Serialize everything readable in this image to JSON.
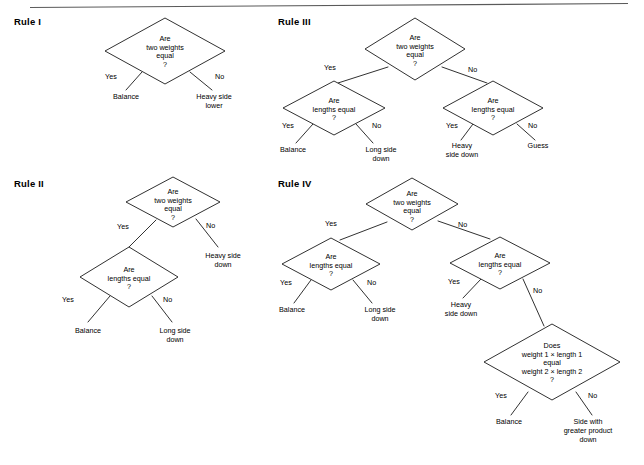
{
  "page": {
    "header_rule_visible": true,
    "header_ghost_text": "",
    "background_color": "#ffffff",
    "ink_color": "#1a1a1a",
    "width": 644,
    "height": 465
  },
  "common_text": {
    "q_two_weights": [
      "Are",
      "two weights",
      "equal",
      "?"
    ],
    "q_lengths": [
      "Are",
      "lengths equal",
      "?"
    ],
    "q_product": [
      "Does",
      "weight 1  ×  length 1",
      "equal",
      "weight 2  ×  length 2",
      "?"
    ],
    "yes": "Yes",
    "no": "No",
    "balance": "Balance",
    "heavy_side_lower": [
      "Heavy side",
      "lower"
    ],
    "heavy_side_down": [
      "Heavy side",
      "down"
    ],
    "heavy_side_down_alt": [
      "Heavy",
      "side down"
    ],
    "long_side_down": [
      "Long side",
      "down"
    ],
    "guess": "Guess",
    "side_with_greater_product_down": [
      "Side with",
      "greater product",
      "down"
    ]
  },
  "rules": [
    {
      "id": "rule-1",
      "title": "Rule I",
      "title_pos": {
        "x": 14,
        "y": 25
      },
      "nodes": [
        {
          "id": "r1-q1",
          "kind": "diamond",
          "cx": 165,
          "cy": 51,
          "rx": 60,
          "ry": 33,
          "lines": [
            "Are",
            "two weights",
            "equal",
            "?"
          ],
          "text_dy": -10
        }
      ],
      "leaves": [
        {
          "id": "r1-leaf-yes",
          "x": 126,
          "y": 99,
          "lines": [
            "Balance"
          ]
        },
        {
          "id": "r1-leaf-no",
          "x": 214,
          "y": 99,
          "lines": [
            "Heavy side",
            "lower"
          ]
        }
      ],
      "edges": [
        {
          "id": "r1-e-yes",
          "x1": 142,
          "y1": 72,
          "x2": 126,
          "y2": 90,
          "label": "Yes",
          "lx": 105,
          "ly": 79
        },
        {
          "id": "r1-e-no",
          "x1": 190,
          "y1": 72,
          "x2": 212,
          "y2": 90,
          "label": "No",
          "lx": 215,
          "ly": 79
        }
      ]
    },
    {
      "id": "rule-2",
      "title": "Rule II",
      "title_pos": {
        "x": 14,
        "y": 187
      },
      "nodes": [
        {
          "id": "r2-q1",
          "kind": "diamond",
          "cx": 173,
          "cy": 202,
          "rx": 47,
          "ry": 25,
          "lines": [
            "Are",
            "two weights",
            "equal",
            "?"
          ],
          "text_dy": -8
        },
        {
          "id": "r2-q2",
          "kind": "diamond",
          "cx": 129,
          "cy": 277,
          "rx": 49,
          "ry": 30,
          "lines": [
            "Are",
            "lengths equal",
            "?"
          ],
          "text_dy": -5
        }
      ],
      "leaves": [
        {
          "id": "r2-leaf-no-top",
          "x": 223,
          "y": 258,
          "lines": [
            "Heavy side",
            "down"
          ]
        },
        {
          "id": "r2-leaf-yes",
          "x": 88,
          "y": 333,
          "lines": [
            "Balance"
          ]
        },
        {
          "id": "r2-leaf-no",
          "x": 175,
          "y": 333,
          "lines": [
            "Long side",
            "down"
          ]
        }
      ],
      "edges": [
        {
          "id": "r2-e-yes",
          "x1": 156,
          "y1": 220,
          "x2": 129,
          "y2": 247,
          "label": "Yes",
          "lx": 117,
          "ly": 229
        },
        {
          "id": "r2-e-no",
          "x1": 196,
          "y1": 219,
          "x2": 218,
          "y2": 247,
          "label": "No",
          "lx": 206,
          "ly": 228
        },
        {
          "id": "r2-e-yes2",
          "x1": 110,
          "y1": 296,
          "x2": 88,
          "y2": 322,
          "label": "Yes",
          "lx": 62,
          "ly": 302
        },
        {
          "id": "r2-e-no2",
          "x1": 152,
          "y1": 296,
          "x2": 172,
          "y2": 322,
          "label": "No",
          "lx": 163,
          "ly": 302
        }
      ]
    },
    {
      "id": "rule-3",
      "title": "Rule III",
      "title_pos": {
        "x": 278,
        "y": 25
      },
      "nodes": [
        {
          "id": "r3-q1",
          "kind": "diamond",
          "cx": 415,
          "cy": 49,
          "rx": 50,
          "ry": 31,
          "lines": [
            "Are",
            "two weights",
            "equal",
            "?"
          ],
          "text_dy": -9
        },
        {
          "id": "r3-q2",
          "kind": "diamond",
          "cx": 334,
          "cy": 108,
          "rx": 51,
          "ry": 27,
          "lines": [
            "Are",
            "lengths equal",
            "?"
          ],
          "text_dy": -5
        },
        {
          "id": "r3-q3",
          "kind": "diamond",
          "cx": 493,
          "cy": 108,
          "rx": 50,
          "ry": 27,
          "lines": [
            "Are",
            "lengths equal",
            "?"
          ],
          "text_dy": -5
        }
      ],
      "leaves": [
        {
          "id": "r3-leaf-a",
          "x": 293,
          "y": 152,
          "lines": [
            "Balance"
          ]
        },
        {
          "id": "r3-leaf-b",
          "x": 381,
          "y": 152,
          "lines": [
            "Long side",
            "down"
          ]
        },
        {
          "id": "r3-leaf-c",
          "x": 462,
          "y": 148,
          "lines": [
            "Heavy",
            "side down"
          ]
        },
        {
          "id": "r3-leaf-d",
          "x": 538,
          "y": 148,
          "lines": [
            "Guess"
          ]
        }
      ],
      "edges": [
        {
          "id": "r3-e-yes",
          "x1": 388,
          "y1": 67,
          "x2": 338,
          "y2": 83,
          "label": "Yes",
          "lx": 324,
          "ly": 70
        },
        {
          "id": "r3-e-no",
          "x1": 442,
          "y1": 67,
          "x2": 487,
          "y2": 83,
          "label": "No",
          "lx": 468,
          "ly": 72
        },
        {
          "id": "r3-e-yes2",
          "x1": 313,
          "y1": 124,
          "x2": 296,
          "y2": 143,
          "label": "Yes",
          "lx": 282,
          "ly": 128
        },
        {
          "id": "r3-e-no2",
          "x1": 356,
          "y1": 124,
          "x2": 373,
          "y2": 143,
          "label": "No",
          "lx": 372,
          "ly": 128
        },
        {
          "id": "r3-e-yes3",
          "x1": 473,
          "y1": 124,
          "x2": 461,
          "y2": 140,
          "label": "Yes",
          "lx": 446,
          "ly": 128
        },
        {
          "id": "r3-e-no3",
          "x1": 517,
          "y1": 124,
          "x2": 535,
          "y2": 140,
          "label": "No",
          "lx": 528,
          "ly": 128
        }
      ]
    },
    {
      "id": "rule-4",
      "title": "Rule IV",
      "title_pos": {
        "x": 278,
        "y": 187
      },
      "nodes": [
        {
          "id": "r4-q1",
          "kind": "diamond",
          "cx": 412,
          "cy": 204,
          "rx": 46,
          "ry": 26,
          "lines": [
            "Are",
            "two weights",
            "equal",
            "?"
          ],
          "text_dy": -8
        },
        {
          "id": "r4-q2",
          "kind": "diamond",
          "cx": 331,
          "cy": 264,
          "rx": 49,
          "ry": 26,
          "lines": [
            "Are",
            "lengths equal",
            "?"
          ],
          "text_dy": -5
        },
        {
          "id": "r4-q3",
          "kind": "diamond",
          "cx": 500,
          "cy": 263,
          "rx": 50,
          "ry": 26,
          "lines": [
            "Are",
            "lengths equal",
            "?"
          ],
          "text_dy": -5
        },
        {
          "id": "r4-q4",
          "kind": "diamond",
          "cx": 552,
          "cy": 362,
          "rx": 68,
          "ry": 38,
          "lines": [
            "Does",
            "weight 1  ×  length 1",
            "equal",
            "weight 2  ×  length 2",
            "?"
          ],
          "text_dy": -14
        }
      ],
      "leaves": [
        {
          "id": "r4-leaf-a",
          "x": 292,
          "y": 312,
          "lines": [
            "Balance"
          ]
        },
        {
          "id": "r4-leaf-b",
          "x": 380,
          "y": 312,
          "lines": [
            "Long side",
            "down"
          ]
        },
        {
          "id": "r4-leaf-c",
          "x": 461,
          "y": 307,
          "lines": [
            "Heavy",
            "side down"
          ]
        },
        {
          "id": "r4-leaf-d",
          "x": 509,
          "y": 424,
          "lines": [
            "Balance"
          ]
        },
        {
          "id": "r4-leaf-e",
          "x": 588,
          "y": 424,
          "lines": [
            "Side with",
            "greater product",
            "down"
          ]
        }
      ],
      "edges": [
        {
          "id": "r4-e-yes",
          "x1": 387,
          "y1": 222,
          "x2": 340,
          "y2": 240,
          "label": "Yes",
          "lx": 325,
          "ly": 226
        },
        {
          "id": "r4-e-no",
          "x1": 438,
          "y1": 221,
          "x2": 490,
          "y2": 239,
          "label": "No",
          "lx": 458,
          "ly": 227
        },
        {
          "id": "r4-e-yes2",
          "x1": 311,
          "y1": 280,
          "x2": 294,
          "y2": 303,
          "label": "Yes",
          "lx": 280,
          "ly": 285
        },
        {
          "id": "r4-e-no2",
          "x1": 353,
          "y1": 280,
          "x2": 372,
          "y2": 303,
          "label": "No",
          "lx": 367,
          "ly": 285
        },
        {
          "id": "r4-e-yes3",
          "x1": 481,
          "y1": 279,
          "x2": 463,
          "y2": 298,
          "label": "Yes",
          "lx": 448,
          "ly": 284
        },
        {
          "id": "r4-e-no3",
          "x1": 523,
          "y1": 279,
          "x2": 544,
          "y2": 326,
          "label": "No",
          "lx": 533,
          "ly": 293
        },
        {
          "id": "r4-e-yes4",
          "x1": 528,
          "y1": 392,
          "x2": 511,
          "y2": 415,
          "label": "Yes",
          "lx": 495,
          "ly": 398
        },
        {
          "id": "r4-e-no4",
          "x1": 576,
          "y1": 392,
          "x2": 592,
          "y2": 415,
          "label": "No",
          "lx": 588,
          "ly": 398
        }
      ]
    }
  ]
}
